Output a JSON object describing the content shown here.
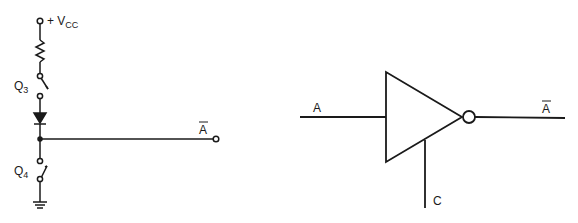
{
  "left_circuit": {
    "supply_label": "+ V",
    "supply_sub": "CC",
    "switch_top_label": "Q",
    "switch_top_sub": "3",
    "switch_bottom_label": "Q",
    "switch_bottom_sub": "4",
    "output_label": "A",
    "output_overbar": true
  },
  "right_circuit": {
    "input_label": "A",
    "control_label": "C",
    "output_label": "A",
    "output_overbar": true,
    "gate_type": "tri-state inverter"
  },
  "colors": {
    "line": "#1a1a1a",
    "background": "#ffffff"
  }
}
